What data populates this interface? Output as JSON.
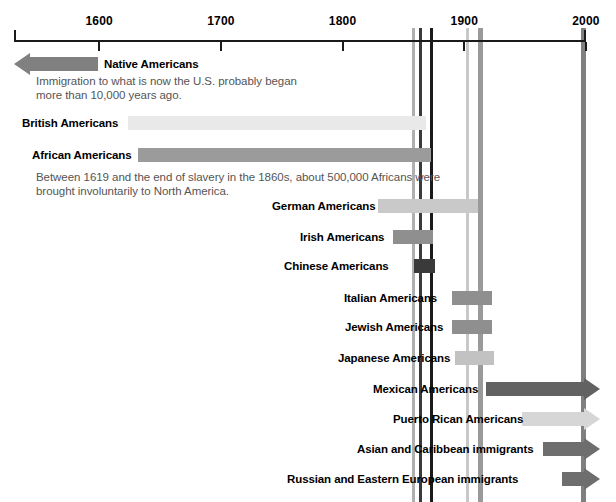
{
  "chart_data": {
    "type": "bar",
    "xlabel": "",
    "ylabel": "",
    "orientation": "horizontal-timeline",
    "grid": false,
    "legend": "none",
    "xlim": [
      1530,
      2010
    ],
    "axis": {
      "ticks": [
        {
          "label": "1600",
          "value": 1600
        },
        {
          "label": "1700",
          "value": 1700
        },
        {
          "label": "1800",
          "value": 1800
        },
        {
          "label": "1900",
          "value": 1900
        },
        {
          "label": "2000",
          "value": 2000
        }
      ],
      "start_value": 1530,
      "end_value": 2000
    },
    "era_bands": [
      {
        "value": 1858,
        "color": "#b0b0b0",
        "width": 3
      },
      {
        "value": 1864,
        "color": "#3a3a3a",
        "width": 3
      },
      {
        "value": 1873,
        "color": "#1a1a1a",
        "width": 3
      },
      {
        "value": 1903,
        "color": "#c8c8c8",
        "width": 3
      },
      {
        "value": 1913,
        "color": "#9a9a9a",
        "width": 5
      },
      {
        "value": 1998,
        "color": "#808080",
        "width": 5
      }
    ],
    "categories": [
      "Native Americans",
      "British Americans",
      "African Americans",
      "German Americans",
      "Irish Americans",
      "Chinese Americans",
      "Italian Americans",
      "Jewish Americans",
      "Japanese Americans",
      "Mexican Americans",
      "Puerto Rican Americans",
      "Asian and Caribbean immigrants",
      "Russian and Eastern European immigrants"
    ],
    "bars": [
      {
        "name": "Native Americans",
        "start": 1530,
        "end": 1600,
        "color": "#808080",
        "arrow": "left",
        "label_side": "right",
        "label_x": 104,
        "bar_x": 14,
        "bar_w": 84,
        "y": 57,
        "note": "Immigration to what is now the U.S. probably began\nmore than 10,000 years ago.",
        "note_x": 36,
        "note_y": 74
      },
      {
        "name": "British Americans",
        "start": 1629,
        "end": 1862,
        "color": "#e9e9e9",
        "arrow": "none",
        "label_side": "left",
        "label_x": 22,
        "bar_x": 128,
        "bar_w": 298,
        "y": 116,
        "note": "",
        "note_x": 0,
        "note_y": 0
      },
      {
        "name": "African Americans",
        "start": 1638,
        "end": 1865,
        "color": "#9b9b9b",
        "arrow": "none",
        "label_side": "left",
        "label_x": 32,
        "bar_x": 138,
        "bar_w": 293,
        "y": 148,
        "note": "Between 1619 and the end of slavery in the 1860s, about 500,000 Africans were\nbrought involuntarily to North America.",
        "note_x": 36,
        "note_y": 170
      },
      {
        "name": "German Americans",
        "start": 1826,
        "end": 1906,
        "color": "#c9c9c9",
        "arrow": "none",
        "label_side": "left",
        "label_x": 272,
        "bar_x": 378,
        "bar_w": 100,
        "y": 199,
        "note": "",
        "note_x": 0,
        "note_y": 0
      },
      {
        "name": "Irish Americans",
        "start": 1838,
        "end": 1870,
        "color": "#8f8f8f",
        "arrow": "none",
        "label_side": "left",
        "label_x": 300,
        "bar_x": 393,
        "bar_w": 40,
        "y": 230,
        "note": "",
        "note_x": 0,
        "note_y": 0
      },
      {
        "name": "Chinese Americans",
        "start": 1856,
        "end": 1873,
        "color": "#3a3a3a",
        "arrow": "none",
        "label_side": "left",
        "label_x": 284,
        "bar_x": 414,
        "bar_w": 21,
        "y": 259,
        "note": "",
        "note_x": 0,
        "note_y": 0
      },
      {
        "name": "Italian Americans",
        "start": 1888,
        "end": 1923,
        "color": "#8f8f8f",
        "arrow": "none",
        "label_side": "left",
        "label_x": 344,
        "bar_x": 452,
        "bar_w": 40,
        "y": 291,
        "note": "",
        "note_x": 0,
        "note_y": 0
      },
      {
        "name": "Jewish Americans",
        "start": 1888,
        "end": 1923,
        "color": "#8f8f8f",
        "arrow": "none",
        "label_side": "left",
        "label_x": 345,
        "bar_x": 452,
        "bar_w": 40,
        "y": 320,
        "note": "",
        "note_x": 0,
        "note_y": 0
      },
      {
        "name": "Japanese Americans",
        "start": 1890,
        "end": 1925,
        "color": "#c2c2c2",
        "arrow": "none",
        "label_side": "left",
        "label_x": 338,
        "bar_x": 455,
        "bar_w": 39,
        "y": 351,
        "note": "",
        "note_x": 0,
        "note_y": 0
      },
      {
        "name": "Mexican Americans",
        "start": 1912,
        "end": 2000,
        "color": "#626262",
        "arrow": "right",
        "label_side": "left",
        "label_x": 373,
        "bar_x": 486,
        "bar_w": 114,
        "y": 382,
        "note": "",
        "note_x": 0,
        "note_y": 0
      },
      {
        "name": "Puerto Rican Americans",
        "start": 1936,
        "end": 2000,
        "color": "#d6d6d6",
        "arrow": "right",
        "label_side": "left",
        "label_x": 393,
        "bar_x": 522,
        "bar_w": 78,
        "y": 412,
        "note": "",
        "note_x": 0,
        "note_y": 0
      },
      {
        "name": "Asian and Caribbean immigrants",
        "start": 1953,
        "end": 2000,
        "color": "#6e6e6e",
        "arrow": "right",
        "label_side": "left",
        "label_x": 357,
        "bar_x": 543,
        "bar_w": 57,
        "y": 442,
        "note": "",
        "note_x": 0,
        "note_y": 0
      },
      {
        "name": "Russian and Eastern European immigrants",
        "start": 1967,
        "end": 2000,
        "color": "#6e6e6e",
        "arrow": "right",
        "label_side": "left",
        "label_x": 287,
        "bar_x": 562,
        "bar_w": 38,
        "y": 472,
        "note": "",
        "note_x": 0,
        "note_y": 0
      }
    ]
  }
}
